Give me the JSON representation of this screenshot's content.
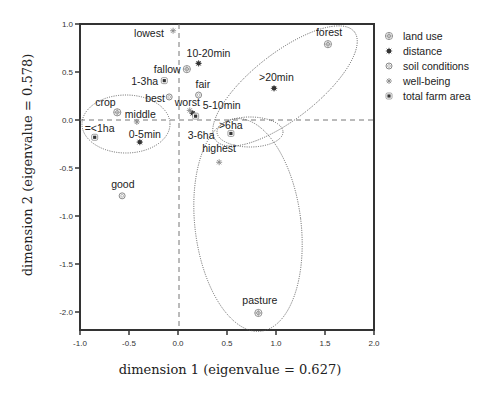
{
  "chart_data": {
    "type": "scatter",
    "title": "",
    "xlabel": "dimension 1 (eigenvalue = 0.627)",
    "ylabel": "dimension 2 (eigenvalue = 0.578)",
    "xlim": [
      -1.0,
      2.0
    ],
    "ylim": [
      -2.2,
      1.0
    ],
    "xticks": [
      -1.0,
      -0.5,
      0.0,
      0.5,
      1.0,
      1.5,
      2.0
    ],
    "xtick_labels": [
      "-1.0",
      "-0.5",
      "0.0",
      "0.5",
      "1.0",
      "1.5",
      "2.0"
    ],
    "yticks": [
      1.0,
      0.5,
      0.0,
      -0.5,
      -1.0,
      -1.5,
      -2.0
    ],
    "ytick_labels": [
      "1.0",
      "0.5",
      "0.0",
      "-0.5",
      "-1.0",
      "-1.5",
      "-2.0"
    ],
    "grid": false,
    "reference_lines": {
      "x": 0.0,
      "y": 0.0,
      "style": "dashed"
    },
    "legend_position": "right",
    "legend": [
      {
        "name": "land use",
        "marker": "circle-cross"
      },
      {
        "name": "distance",
        "marker": "star-filled"
      },
      {
        "name": "soil conditions",
        "marker": "circle-open"
      },
      {
        "name": "well-being",
        "marker": "asterisk"
      },
      {
        "name": "total farm area",
        "marker": "square-dot"
      }
    ],
    "series": [
      {
        "name": "land use",
        "points": [
          {
            "label": "crop",
            "x": -0.62,
            "y": 0.08,
            "lx": -22,
            "ly": -6
          },
          {
            "label": "fallow",
            "x": 0.09,
            "y": 0.53,
            "lx": -33,
            "ly": 4
          },
          {
            "label": "forest",
            "x": 1.53,
            "y": 0.79,
            "lx": -12,
            "ly": -8
          },
          {
            "label": "pasture",
            "x": 0.82,
            "y": -2.01,
            "lx": -16,
            "ly": -9
          }
        ]
      },
      {
        "name": "distance",
        "points": [
          {
            "label": "10-20min",
            "x": 0.21,
            "y": 0.59,
            "lx": -12,
            "ly": -6
          },
          {
            "label": "5-10min",
            "x": 0.15,
            "y": 0.07,
            "lx": 10,
            "ly": -4
          },
          {
            "label": "0-5min",
            "x": -0.39,
            "y": -0.23,
            "lx": -11,
            "ly": -4
          },
          {
            "label": ">20min",
            "x": 0.98,
            "y": 0.33,
            "lx": -15,
            "ly": -7
          }
        ]
      },
      {
        "name": "soil conditions",
        "points": [
          {
            "label": "best",
            "x": -0.09,
            "y": 0.24,
            "lx": -24,
            "ly": 5
          },
          {
            "label": "fair",
            "x": 0.21,
            "y": 0.26,
            "lx": -3,
            "ly": -7
          },
          {
            "label": "good",
            "x": -0.57,
            "y": -0.79,
            "lx": -11,
            "ly": -8
          }
        ]
      },
      {
        "name": "well-being",
        "points": [
          {
            "label": "lowest",
            "x": -0.05,
            "y": 0.93,
            "lx": -39,
            "ly": 6
          },
          {
            "label": "worst",
            "x": 0.12,
            "y": 0.1,
            "lx": -15,
            "ly": -4
          },
          {
            "label": "middle",
            "x": -0.42,
            "y": -0.02,
            "lx": -12,
            "ly": -4
          },
          {
            "label": "highest",
            "x": 0.42,
            "y": -0.44,
            "lx": -17,
            "ly": -10
          }
        ]
      },
      {
        "name": "total farm area",
        "points": [
          {
            "label": "1-3ha",
            "x": -0.14,
            "y": 0.41,
            "lx": -33,
            "ly": 4
          },
          {
            "label": "3-6ha",
            "x": 0.18,
            "y": 0.04,
            "lx": -8,
            "ly": 23
          },
          {
            "label": "=<1ha",
            "x": -0.85,
            "y": -0.18,
            "lx": -10,
            "ly": -5
          },
          {
            "label": ">6ha",
            "x": 0.54,
            "y": -0.14,
            "lx": -12,
            "ly": -4
          }
        ]
      }
    ],
    "annotations": [
      {
        "type": "ellipse",
        "style": "dotted",
        "encloses": [
          "crop",
          "middle",
          "=<1ha",
          "0-5min"
        ]
      },
      {
        "type": "ellipse",
        "style": "dotted",
        "encloses": [
          "forest",
          ">20min",
          ">6ha"
        ]
      },
      {
        "type": "ellipse",
        "style": "dotted",
        "encloses": [
          ">6ha"
        ]
      },
      {
        "type": "ellipse",
        "style": "dotted",
        "encloses": [
          "highest",
          "pasture"
        ]
      }
    ]
  },
  "colors": {
    "axis": "#333333",
    "marker": "#333333",
    "marker_light": "#888888",
    "reference_line": "#777777",
    "ellipse": "#555555"
  }
}
